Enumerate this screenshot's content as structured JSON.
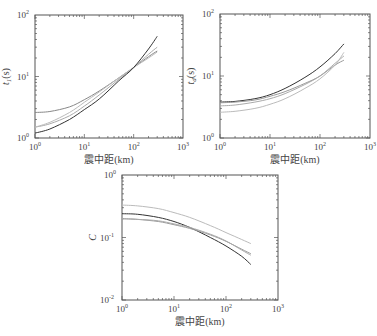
{
  "chart_data": [
    {
      "type": "line",
      "title": "",
      "xlabel": "震中距(km)",
      "ylabel": "t_1(s)",
      "xscale": "log",
      "yscale": "log",
      "xlim": [
        1,
        1000
      ],
      "ylim": [
        1,
        100
      ],
      "xticks": [
        "10^0",
        "10^1",
        "10^2",
        "10^3"
      ],
      "yticks": [
        "10^0",
        "10^1",
        "10^2"
      ],
      "grid": false,
      "legend": null,
      "x": [
        1,
        2,
        5,
        10,
        20,
        50,
        100,
        200,
        300
      ],
      "series": [
        {
          "name": "curve-1",
          "color": "#888888",
          "values": [
            2.6,
            2.7,
            3.2,
            4.2,
            5.8,
            9.5,
            14,
            21,
            26
          ]
        },
        {
          "name": "curve-2",
          "color": "#aaaaaa",
          "values": [
            1.5,
            1.7,
            2.3,
            3.3,
            5.0,
            9.0,
            14,
            23,
            30
          ]
        },
        {
          "name": "curve-3",
          "color": "#bbbbbb",
          "values": [
            1.5,
            1.8,
            2.6,
            3.8,
            5.6,
            9.5,
            14,
            20,
            25
          ]
        },
        {
          "name": "curve-4",
          "color": "#333333",
          "values": [
            1.2,
            1.4,
            2.0,
            2.9,
            4.3,
            8.5,
            14,
            28,
            45
          ]
        }
      ]
    },
    {
      "type": "line",
      "title": "",
      "xlabel": "震中距(km)",
      "ylabel": "t_d(s)",
      "xscale": "log",
      "yscale": "log",
      "xlim": [
        1,
        1000
      ],
      "ylim": [
        1,
        100
      ],
      "xticks": [
        "10^0",
        "10^1",
        "10^2",
        "10^3"
      ],
      "yticks": [
        "10^0",
        "10^1",
        "10^2"
      ],
      "grid": false,
      "legend": null,
      "x": [
        1,
        2,
        5,
        10,
        20,
        50,
        100,
        200,
        300
      ],
      "series": [
        {
          "name": "curve-1",
          "color": "#333333",
          "values": [
            3.8,
            3.9,
            4.3,
            5.0,
            6.3,
            9.5,
            14,
            23,
            33
          ]
        },
        {
          "name": "curve-2",
          "color": "#999999",
          "values": [
            3.7,
            3.8,
            4.1,
            4.7,
            5.6,
            7.6,
            10,
            15,
            18
          ]
        },
        {
          "name": "curve-3",
          "color": "#aaaaaa",
          "values": [
            3.3,
            3.4,
            3.8,
            4.3,
            5.2,
            7.3,
            10,
            16,
            21
          ]
        },
        {
          "name": "curve-4",
          "color": "#bbbbbb",
          "values": [
            2.6,
            2.7,
            3.0,
            3.5,
            4.3,
            6.3,
            9,
            15,
            24
          ]
        }
      ]
    },
    {
      "type": "line",
      "title": "",
      "xlabel": "震中距(km)",
      "ylabel": "C",
      "xscale": "log",
      "yscale": "log",
      "xlim": [
        1,
        1000
      ],
      "ylim": [
        0.01,
        1
      ],
      "xticks": [
        "10^0",
        "10^1",
        "10^2",
        "10^3"
      ],
      "yticks": [
        "10^-2",
        "10^-1",
        "10^0"
      ],
      "grid": false,
      "legend": null,
      "x": [
        1,
        2,
        5,
        10,
        20,
        50,
        100,
        200,
        300
      ],
      "series": [
        {
          "name": "curve-1",
          "color": "#bbbbbb",
          "values": [
            0.33,
            0.32,
            0.29,
            0.25,
            0.21,
            0.155,
            0.12,
            0.093,
            0.08
          ]
        },
        {
          "name": "curve-2",
          "color": "#333333",
          "values": [
            0.24,
            0.235,
            0.21,
            0.18,
            0.145,
            0.1,
            0.073,
            0.05,
            0.037
          ]
        },
        {
          "name": "curve-3",
          "color": "#999999",
          "values": [
            0.2,
            0.195,
            0.18,
            0.16,
            0.14,
            0.11,
            0.087,
            0.065,
            0.055
          ]
        },
        {
          "name": "curve-4",
          "color": "#aaaaaa",
          "values": [
            0.2,
            0.195,
            0.185,
            0.165,
            0.145,
            0.113,
            0.088,
            0.063,
            0.052
          ]
        }
      ]
    }
  ],
  "panels": [
    {
      "box": [
        35,
        15,
        183,
        138
      ],
      "ylabel_main": "t",
      "ylabel_sub": "1",
      "ylabel_unit": "(s)",
      "xlabel": "震中距(km)",
      "xtick_labels": [
        {
          "base": "10",
          "exp": "0"
        },
        {
          "base": "10",
          "exp": "1"
        },
        {
          "base": "10",
          "exp": "2"
        },
        {
          "base": "10",
          "exp": "3"
        }
      ],
      "ytick_labels": [
        {
          "base": "10",
          "exp": "0"
        },
        {
          "base": "10",
          "exp": "1"
        },
        {
          "base": "10",
          "exp": "2"
        }
      ]
    },
    {
      "box": [
        220,
        14,
        370,
        138
      ],
      "ylabel_main": "t",
      "ylabel_sub": "d",
      "ylabel_unit": "(s)",
      "xlabel": "震中距(km)",
      "xtick_labels": [
        {
          "base": "10",
          "exp": "0"
        },
        {
          "base": "10",
          "exp": "1"
        },
        {
          "base": "10",
          "exp": "2"
        },
        {
          "base": "10",
          "exp": "3"
        }
      ],
      "ytick_labels": [
        {
          "base": "10",
          "exp": "0"
        },
        {
          "base": "10",
          "exp": "1"
        },
        {
          "base": "10",
          "exp": "2"
        }
      ]
    },
    {
      "box": [
        122,
        175,
        278,
        300
      ],
      "ylabel_main": "C",
      "ylabel_sub": "",
      "ylabel_unit": "",
      "xlabel": "震中距(km)",
      "xtick_labels": [
        {
          "base": "10",
          "exp": "0"
        },
        {
          "base": "10",
          "exp": "1"
        },
        {
          "base": "10",
          "exp": "2"
        },
        {
          "base": "10",
          "exp": "3"
        }
      ],
      "ytick_labels": [
        {
          "base": "10",
          "exp": "-2"
        },
        {
          "base": "10",
          "exp": "-1"
        },
        {
          "base": "10",
          "exp": "0"
        }
      ]
    }
  ]
}
